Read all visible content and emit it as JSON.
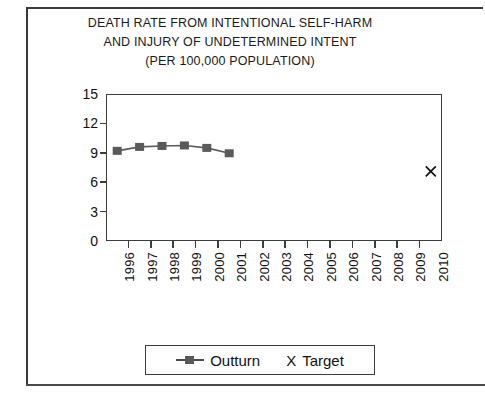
{
  "chart_data": {
    "type": "line",
    "title": "DEATH RATE FROM INTENTIONAL SELF-HARM AND INJURY OF UNDETERMINED INTENT (PER 100,000 POPULATION)",
    "title_lines": [
      "DEATH RATE FROM INTENTIONAL SELF-HARM",
      "AND INJURY OF UNDETERMINED INTENT",
      "(PER 100,000 POPULATION)"
    ],
    "xlabel": "",
    "ylabel": "",
    "ylim": [
      0,
      15
    ],
    "y_ticks": [
      0,
      3,
      6,
      9,
      12,
      15
    ],
    "y_tick_labels": [
      "0",
      "3",
      "6",
      "9",
      "12",
      "15"
    ],
    "grid": false,
    "legend_position": "bottom",
    "categories": [
      "1996",
      "1997",
      "1998",
      "1999",
      "2000",
      "2001",
      "2002",
      "2003",
      "2004",
      "2005",
      "2006",
      "2007",
      "2008",
      "2009",
      "2010"
    ],
    "series": [
      {
        "name": "Outturn",
        "marker": "square",
        "color": "#5a5a5a",
        "x": [
          "1996",
          "1997",
          "1998",
          "1999",
          "2000",
          "2001"
        ],
        "values": [
          9.2,
          9.6,
          9.7,
          9.75,
          9.5,
          8.95
        ]
      },
      {
        "name": "Target",
        "marker": "x",
        "color": "#111111",
        "x": [
          "2010"
        ],
        "values": [
          7.1
        ]
      }
    ]
  },
  "legend": {
    "outturn_label": "Outturn",
    "target_glyph": "X",
    "target_label": "Target"
  }
}
